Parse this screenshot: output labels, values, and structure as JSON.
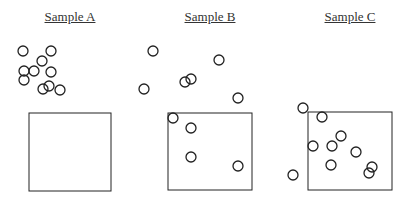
{
  "samples": [
    {
      "label": "Sample A",
      "title_x": 20,
      "box": {
        "x": 29,
        "y": 113,
        "w": 82,
        "h": 78
      },
      "particles": [
        [
          23,
          51
        ],
        [
          51,
          51
        ],
        [
          42,
          61
        ],
        [
          24,
          71
        ],
        [
          34,
          71
        ],
        [
          51,
          72
        ],
        [
          24,
          80
        ],
        [
          43,
          89
        ],
        [
          49,
          86
        ],
        [
          60,
          90
        ]
      ]
    },
    {
      "label": "Sample B",
      "title_x": 160,
      "box": {
        "x": 168,
        "y": 113,
        "w": 84,
        "h": 77
      },
      "particles": [
        [
          153,
          51
        ],
        [
          219,
          60
        ],
        [
          144,
          89
        ],
        [
          185,
          82
        ],
        [
          191,
          79
        ],
        [
          238,
          98
        ],
        [
          173,
          118
        ],
        [
          191,
          128
        ],
        [
          191,
          157
        ],
        [
          238,
          166
        ]
      ]
    },
    {
      "label": "Sample C",
      "title_x": 300,
      "box": {
        "x": 308,
        "y": 112,
        "w": 84,
        "h": 78
      },
      "particles": [
        [
          303,
          108
        ],
        [
          322,
          117
        ],
        [
          313,
          146
        ],
        [
          332,
          146
        ],
        [
          341,
          136
        ],
        [
          356,
          152
        ],
        [
          331,
          165
        ],
        [
          293,
          175
        ],
        [
          369,
          173
        ],
        [
          372,
          167
        ]
      ]
    }
  ],
  "style": {
    "stroke": "#222222",
    "radius": 5
  }
}
